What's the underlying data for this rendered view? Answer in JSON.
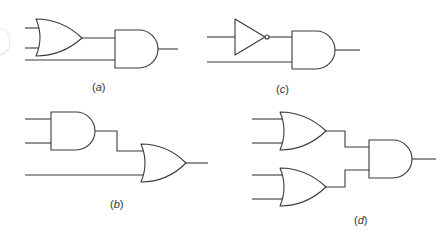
{
  "figure": {
    "colors": {
      "stroke": "#3a3a3a",
      "background": "#ffffff",
      "label": "#333333"
    }
  },
  "circuits": [
    {
      "id": "a",
      "label_open": "(",
      "label_letter": "a",
      "label_close": ")",
      "gates": [
        "OR (2 inputs)",
        "AND (2 inputs)"
      ],
      "description": "Two inputs into OR gate; OR output and a third input feed an AND gate"
    },
    {
      "id": "b",
      "label_open": "(",
      "label_letter": "b",
      "label_close": ")",
      "gates": [
        "AND (2 inputs)",
        "OR (2 inputs)"
      ],
      "description": "Two inputs into AND gate; AND output and a third input feed an OR gate"
    },
    {
      "id": "c",
      "label_open": "(",
      "label_letter": "c",
      "label_close": ")",
      "gates": [
        "NOT",
        "AND (2 inputs)"
      ],
      "description": "One input inverted by NOT gate; inverted signal and a second input feed an AND gate"
    },
    {
      "id": "d",
      "label_open": "(",
      "label_letter": "d",
      "label_close": ")",
      "gates": [
        "OR (2 inputs)",
        "OR (2 inputs)",
        "AND (2 inputs)"
      ],
      "description": "Two OR gates with two inputs each; their outputs feed an AND gate"
    }
  ]
}
